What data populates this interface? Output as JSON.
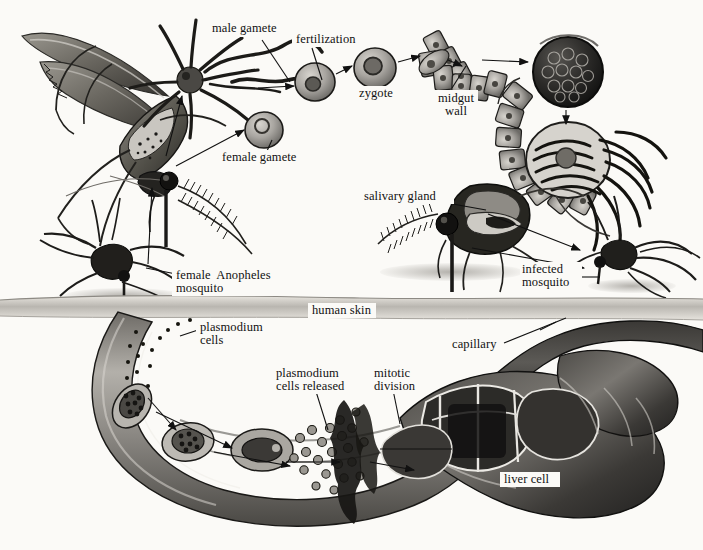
{
  "figure": {
    "background_color": "#fbfaf7",
    "ink_color": "#111111",
    "style": "grayscale scientific pen-and-wash illustration"
  },
  "labels": {
    "male_gamete": "male gamete",
    "fertilization": "fertilization",
    "zygote": "zygote",
    "midgut_wall": "midgut\nwall",
    "female_gamete": "female gamete",
    "salivary_gland": "salivary gland",
    "infected_mosquito": "infected\nmosquito",
    "female_anopheles_mosquito": "female  Anopheles\nmosquito",
    "human_skin": "human skin",
    "plasmodium_cells": "plasmodium\ncells",
    "plasmodium_cells_released": "plasmodium\ncells released",
    "mitotic_division": "mitotic\ndivision",
    "capillary": "capillary",
    "liver_cell": "liver cell"
  }
}
